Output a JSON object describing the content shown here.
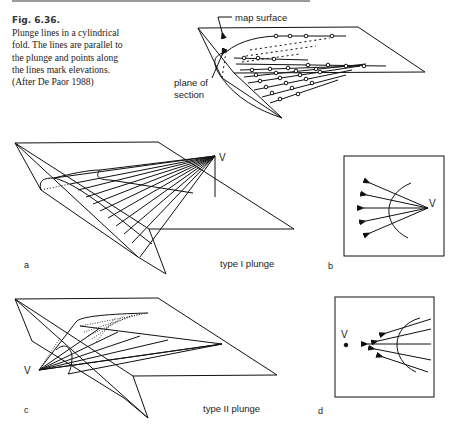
{
  "caption": {
    "figure_number": "Fig. 6.36.",
    "lines": [
      "Plunge lines in a cylindrical",
      "fold. The lines are parallel to",
      "the plunge and points along",
      "the lines mark elevations.",
      "(After De Paor 1988)"
    ]
  },
  "top_figure": {
    "label_map_surface": "map surface",
    "label_plane_of": "plane of",
    "label_section": "section"
  },
  "panel_a": {
    "letter": "a",
    "vertex_label": "V",
    "type_label": "type I plunge"
  },
  "panel_b": {
    "letter": "b",
    "vertex_label": "V"
  },
  "panel_c": {
    "letter": "c",
    "vertex_label": "V",
    "type_label": "type II plunge"
  },
  "panel_d": {
    "letter": "d",
    "vertex_label": "V"
  }
}
